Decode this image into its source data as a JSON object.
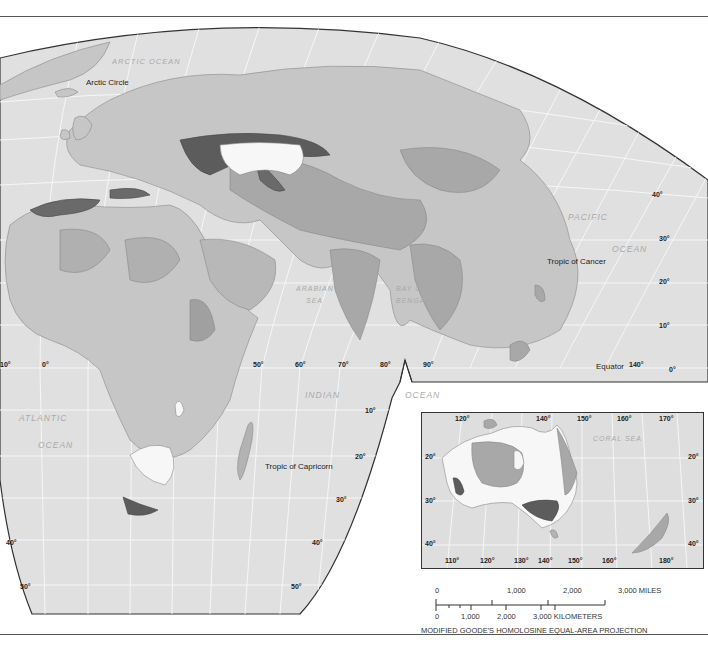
{
  "map": {
    "projection_note": "MODIFIED GOODE'S HOMOLOSINE EQUAL-AREA PROJECTION",
    "colors": {
      "ocean_graticule_bg": "#e0e0e0",
      "land_base": "#c6c6c6",
      "region_mid": "#a8a8a8",
      "region_dark": "#777777",
      "region_darkest": "#5c5c5c",
      "region_light": "#f7f7f7",
      "graticule": "#f6f6f6",
      "outline": "#333333"
    },
    "ocean_labels": {
      "arctic": "ARCTIC OCEAN",
      "pacific_1": "PACIFIC",
      "pacific_2": "OCEAN",
      "arabian_1": "ARABIAN",
      "arabian_2": "SEA",
      "bengal_1": "BAY OF",
      "bengal_2": "BENGAL",
      "indian_1": "INDIAN",
      "indian_2": "OCEAN",
      "atlantic_1": "ATLANTIC",
      "atlantic_2": "OCEAN",
      "coral": "CORAL SEA"
    },
    "lines": {
      "arctic_circle": "Arctic Circle",
      "tropic_cancer": "Tropic of Cancer",
      "equator": "Equator",
      "tropic_capricorn": "Tropic of Capricorn"
    },
    "longitude_labels": [
      "10°",
      "0°",
      "50°",
      "60°",
      "70°",
      "80°",
      "90°",
      "140°"
    ],
    "latitude_labels_right": [
      "40°",
      "30°",
      "20°",
      "10°",
      "0°"
    ],
    "latitude_labels_south": [
      "10°",
      "20°",
      "30°",
      "40°",
      "50°"
    ],
    "latitude_labels_south_left": [
      "40°",
      "50°"
    ],
    "inset": {
      "name": "Australia inset",
      "top_longitudes": [
        "120°",
        "140°",
        "150°",
        "160°",
        "170°"
      ],
      "bottom_longitudes": [
        "110°",
        "120°",
        "130°",
        "140°",
        "150°",
        "160°",
        "180°"
      ],
      "left_latitudes": [
        "20°",
        "30°",
        "40°"
      ],
      "right_latitudes": [
        "20°",
        "30°",
        "40°"
      ]
    },
    "scale": {
      "miles": [
        "0",
        "1,000",
        "2,000",
        "3,000 MILES"
      ],
      "kilometers": [
        "0",
        "1,000",
        "2,000",
        "3,000 KILOMETERS"
      ]
    }
  }
}
